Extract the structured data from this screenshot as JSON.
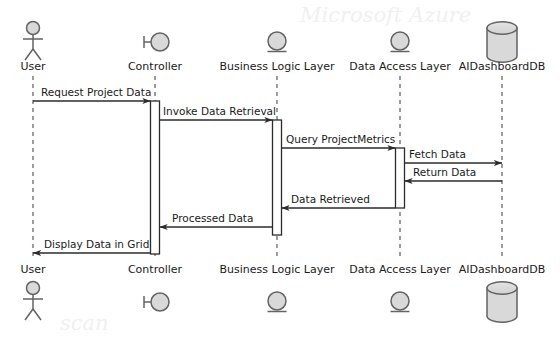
{
  "diagram": {
    "type": "uml-sequence-diagram",
    "canvas": {
      "width": 560,
      "height": 345,
      "background": "#ffffff"
    },
    "colors": {
      "line": "#2b2b2b",
      "lifeline": "#555555",
      "icon_fill": "#d9d9d9",
      "icon_stroke": "#636363",
      "text": "#1a1a1a"
    }
  },
  "participants": [
    {
      "id": "user",
      "label": "User",
      "icon": "actor-stick-figure-icon",
      "x": 33,
      "activation": {
        "top": 101,
        "bottom": 101
      }
    },
    {
      "id": "controller",
      "label": "Controller",
      "icon": "control-circle-icon",
      "x": 155,
      "activation": {
        "top": 101,
        "bottom": 254
      }
    },
    {
      "id": "bll",
      "label": "Business Logic Layer",
      "icon": "entity-circle-icon",
      "x": 277,
      "activation": {
        "top": 120,
        "bottom": 235
      }
    },
    {
      "id": "dal",
      "label": "Data Access Layer",
      "icon": "entity-circle-icon",
      "x": 400,
      "activation": {
        "top": 148,
        "bottom": 208
      }
    },
    {
      "id": "db",
      "label": "AIDashboardDB",
      "icon": "database-cylinder-icon",
      "x": 502,
      "activation": null
    }
  ],
  "messages": [
    {
      "seq": 1,
      "label": "Request Project Data",
      "from": "user",
      "to": "controller",
      "y": 101,
      "direction": "right",
      "label_x": 41,
      "label_y": 96
    },
    {
      "seq": 2,
      "label": "Invoke Data Retrieval",
      "from": "controller",
      "to": "bll",
      "y": 120,
      "direction": "right",
      "label_x": 163,
      "label_y": 115
    },
    {
      "seq": 3,
      "label": "Query ProjectMetrics",
      "from": "bll",
      "to": "dal",
      "y": 148,
      "direction": "right",
      "label_x": 286,
      "label_y": 143
    },
    {
      "seq": 4,
      "label": "Fetch Data",
      "from": "dal",
      "to": "db",
      "y": 163,
      "direction": "right",
      "label_x": 409,
      "label_y": 158
    },
    {
      "seq": 5,
      "label": "Return Data",
      "from": "db",
      "to": "dal",
      "y": 181,
      "direction": "left",
      "label_x": 413,
      "label_y": 176
    },
    {
      "seq": 6,
      "label": "Data Retrieved",
      "from": "dal",
      "to": "bll",
      "y": 208,
      "direction": "left",
      "label_x": 291,
      "label_y": 203
    },
    {
      "seq": 7,
      "label": "Processed Data",
      "from": "bll",
      "to": "controller",
      "y": 227,
      "direction": "left",
      "label_x": 172,
      "label_y": 222
    },
    {
      "seq": 8,
      "label": "Display Data in Grid",
      "from": "controller",
      "to": "user",
      "y": 253,
      "direction": "left",
      "label_x": 44,
      "label_y": 248
    }
  ],
  "header": {
    "label_y": 70,
    "icon_center_y": 42
  },
  "footer": {
    "label_y": 273,
    "icon_center_y": 302
  }
}
